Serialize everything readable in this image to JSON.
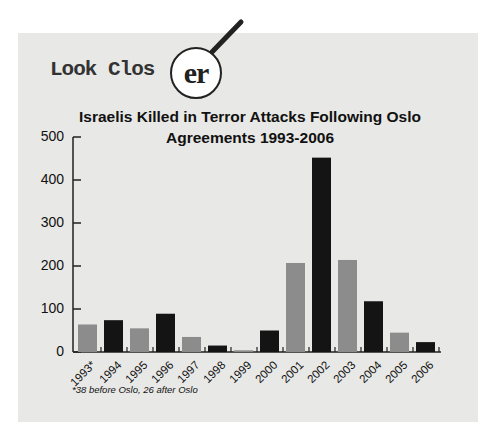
{
  "header": {
    "prefix": "Look Clos",
    "magnified": "er"
  },
  "chart_data": {
    "type": "bar",
    "title": "Israelis Killed in Terror Attacks Following Oslo Agreements 1993-2006",
    "title_lines": [
      "Israelis Killed in Terror Attacks Following Oslo",
      "Agreements 1993-2006"
    ],
    "xlabel": "",
    "ylabel": "",
    "ylim": [
      0,
      500
    ],
    "yticks": [
      0,
      100,
      200,
      300,
      400,
      500
    ],
    "grid": false,
    "categories": [
      "1993*",
      "1994",
      "1995",
      "1996",
      "1997",
      "1998",
      "1999",
      "2000",
      "2001",
      "2002",
      "2003",
      "2004",
      "2005",
      "2006"
    ],
    "values": [
      64,
      74,
      55,
      89,
      35,
      15,
      4,
      50,
      207,
      452,
      214,
      118,
      45,
      23
    ],
    "bar_colors": [
      "#8c8c8c",
      "#141414",
      "#8c8c8c",
      "#141414",
      "#8c8c8c",
      "#141414",
      "#8c8c8c",
      "#141414",
      "#8c8c8c",
      "#141414",
      "#8c8c8c",
      "#141414",
      "#8c8c8c",
      "#141414"
    ],
    "footnote": "*38 before Oslo, 26 after Oslo"
  },
  "colors": {
    "panel": "#e8e8e6",
    "bar_light": "#8c8c8c",
    "bar_dark": "#141414",
    "axis": "#222222"
  }
}
